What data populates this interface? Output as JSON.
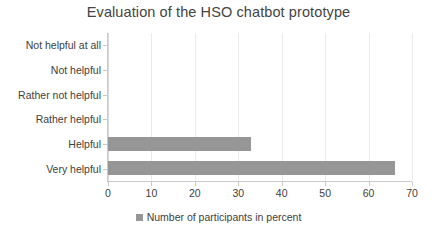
{
  "chart_data": {
    "type": "bar",
    "orientation": "horizontal",
    "title": "Evaluation of the HSO chatbot prototype",
    "xlabel": "",
    "ylabel": "",
    "categories": [
      "Not helpful at all",
      "Not helpful",
      "Rather not helpful",
      "Rather helpful",
      "Helpful",
      "Very helpful"
    ],
    "values": [
      0,
      0,
      0,
      0,
      33,
      66
    ],
    "series": [
      {
        "name": "Number of participants in percent",
        "values": [
          0,
          0,
          0,
          0,
          33,
          66
        ]
      }
    ],
    "xlim": [
      0,
      70
    ],
    "xticks": [
      0,
      10,
      20,
      30,
      40,
      50,
      60,
      70
    ],
    "xtick_labels": [
      "0",
      "10",
      "20",
      "30",
      "40",
      "50",
      "60",
      "70"
    ],
    "grid": "vertical",
    "legend": {
      "position": "bottom",
      "entries": [
        {
          "label": "Number of participants in percent",
          "color": "#969696"
        }
      ]
    },
    "colors": {
      "bar": "#969696",
      "title_text": "#444444",
      "axis_text": "#404040",
      "gridline": "#eaeaea",
      "axis_line": "#c9c9c9",
      "background": "#ffffff"
    }
  }
}
